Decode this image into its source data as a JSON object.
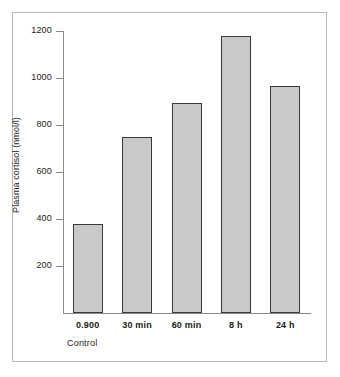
{
  "chart_data": {
    "type": "bar",
    "title": "",
    "xlabel": "",
    "ylabel": "Plasma cortisol (nmol/l)",
    "categories": [
      "0.900",
      "30 min",
      "60 min",
      "8 h",
      "24 h"
    ],
    "values": [
      380,
      750,
      895,
      1180,
      965
    ],
    "ylim": [
      0,
      1200
    ],
    "yticks": [
      200,
      400,
      600,
      800,
      1000,
      1200
    ],
    "ytick_labels": [
      "200",
      "400",
      "600",
      "800",
      "1000",
      "1200"
    ],
    "grid": false,
    "legend": null,
    "annotations": [
      {
        "name": "control-label",
        "text": "Control",
        "note": "appears below the first category label 0.900"
      }
    ],
    "bar_fill_color": "#c9c9c9",
    "bar_edge_color": "#3a3a3a",
    "axis_color": "#8a8a8a",
    "frame_color": "#b9b9b9",
    "background_color": "#ffffff"
  }
}
